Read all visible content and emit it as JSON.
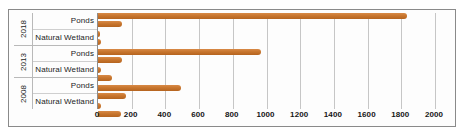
{
  "chart_data": {
    "type": "bar",
    "orientation": "horizontal",
    "title": "",
    "xlabel": "",
    "ylabel": "",
    "xlim": [
      0,
      2000
    ],
    "xticks": [
      0,
      200,
      400,
      600,
      800,
      1000,
      1200,
      1400,
      1600,
      1800,
      2000
    ],
    "xtick_labels": [
      "0",
      "200",
      "400",
      "600",
      "800",
      "1000",
      "1200",
      "1400",
      "1600",
      "1800",
      "2000"
    ],
    "grid": true,
    "legend": "none",
    "bar_color": "#c8762e",
    "groups": [
      {
        "group_label": "2018",
        "categories": [
          {
            "label": "Ponds",
            "values": [
              1835,
              140
            ]
          },
          {
            "label": "Natural Wetland",
            "values": [
              10,
              20
            ]
          }
        ]
      },
      {
        "group_label": "2013",
        "categories": [
          {
            "label": "Ponds",
            "values": [
              970,
              140
            ]
          },
          {
            "label": "Natural Wetland",
            "values": [
              18,
              85
            ]
          }
        ]
      },
      {
        "group_label": "2008",
        "categories": [
          {
            "label": "Ponds",
            "values": [
              490,
              165
            ]
          },
          {
            "label": "Natural Wetland",
            "values": [
              15,
              135
            ]
          }
        ]
      }
    ],
    "bars_flat": [
      {
        "group": "2018",
        "category": "Ponds",
        "value": 1835
      },
      {
        "group": "2018",
        "category": "Ponds",
        "value": 140
      },
      {
        "group": "2018",
        "category": "Natural Wetland",
        "value": 10
      },
      {
        "group": "2018",
        "category": "Natural Wetland",
        "value": 20
      },
      {
        "group": "2013",
        "category": "Ponds",
        "value": 970
      },
      {
        "group": "2013",
        "category": "Ponds",
        "value": 140
      },
      {
        "group": "2013",
        "category": "Natural Wetland",
        "value": 18
      },
      {
        "group": "2013",
        "category": "Natural Wetland",
        "value": 85
      },
      {
        "group": "2008",
        "category": "Ponds",
        "value": 490
      },
      {
        "group": "2008",
        "category": "Ponds",
        "value": 165
      },
      {
        "group": "2008",
        "category": "Natural Wetland",
        "value": 15
      },
      {
        "group": "2008",
        "category": "Natural Wetland",
        "value": 135
      }
    ]
  }
}
